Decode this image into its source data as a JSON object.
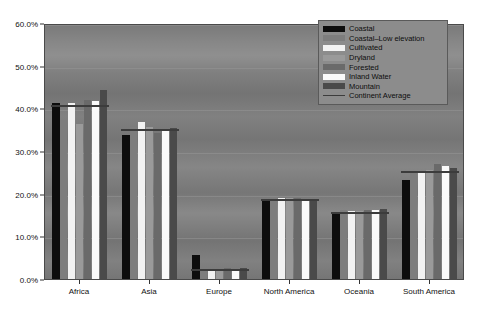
{
  "chart_data": {
    "type": "bar",
    "title": "",
    "xlabel": "",
    "ylabel": "",
    "ylim": [
      0,
      60
    ],
    "ytick_labels": [
      "0.0%",
      "10.0%",
      "20.0%",
      "30.0%",
      "40.0%",
      "50.0%",
      "60.0%"
    ],
    "ytick_values": [
      0,
      10,
      20,
      30,
      40,
      50,
      60
    ],
    "grid": true,
    "grid_axis": "y",
    "legend_position": "top-right",
    "value_unit": "percent",
    "categories": [
      "Africa",
      "Asia",
      "Europe",
      "North America",
      "Oceania",
      "South America"
    ],
    "series": [
      {
        "name": "Coastal",
        "color": "#0d0d0d",
        "values": [
          41.2,
          33.8,
          5.6,
          18.6,
          15.3,
          23.2
        ]
      },
      {
        "name": "Coastal–Low elevation",
        "color": "#7d7d7d",
        "values": [
          37.2,
          35.7,
          2.6,
          19.3,
          16.1,
          25.1
        ]
      },
      {
        "name": "Cultivated",
        "color": "#f2f2f2",
        "values": [
          41.2,
          36.7,
          2.4,
          18.9,
          16.0,
          25.3
        ]
      },
      {
        "name": "Dryland",
        "color": "#9a9a9a",
        "values": [
          36.3,
          35.6,
          2.3,
          19.0,
          15.9,
          25.6
        ]
      },
      {
        "name": "Forested",
        "color": "#6a6a6a",
        "values": [
          42.0,
          34.2,
          2.5,
          18.9,
          16.1,
          27.0
        ]
      },
      {
        "name": "Inland Water",
        "color": "#fafafa",
        "values": [
          41.8,
          35.2,
          2.4,
          18.7,
          16.2,
          26.4
        ]
      },
      {
        "name": "Mountain",
        "color": "#4a4a4a",
        "values": [
          44.2,
          35.3,
          2.6,
          18.5,
          16.3,
          26.0
        ]
      }
    ],
    "reference_line": {
      "name": "Continent Average",
      "color": "#3c3c3c",
      "values": [
        41.0,
        35.5,
        2.5,
        18.9,
        16.0,
        25.6
      ]
    }
  },
  "legend": {
    "items": [
      {
        "label": "Coastal",
        "swatch": "fill"
      },
      {
        "label": "Coastal–Low elevation",
        "swatch": "fill"
      },
      {
        "label": "Cultivated",
        "swatch": "fill"
      },
      {
        "label": "Dryland",
        "swatch": "fill"
      },
      {
        "label": "Forested",
        "swatch": "fill"
      },
      {
        "label": "Inland Water",
        "swatch": "fill"
      },
      {
        "label": "Mountain",
        "swatch": "fill"
      },
      {
        "label": "Continent Average",
        "swatch": "line"
      }
    ]
  },
  "theme": {
    "plot_background": "#7a7a7a",
    "legend_background": "#8c8c8c",
    "axis_color": "#333333",
    "text_color": "#111111",
    "gridline_color": "#969696"
  }
}
